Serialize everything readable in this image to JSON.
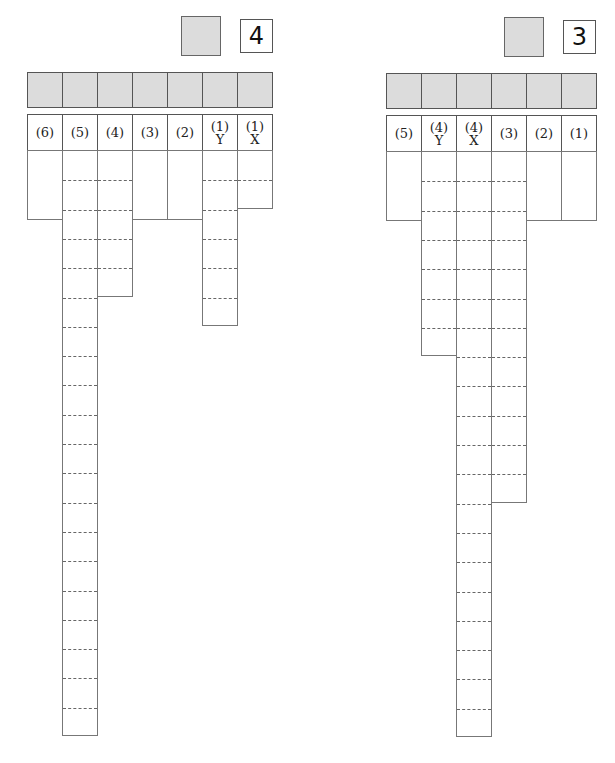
{
  "panels": [
    {
      "id": "left",
      "number_label": "4",
      "gray_square": {
        "x": 181,
        "y": 16,
        "w": 40,
        "h": 40
      },
      "number_box": {
        "x": 240,
        "y": 19,
        "w": 33,
        "h": 34
      },
      "grid_x": 27,
      "col_width": 35,
      "gray_row": {
        "y": 72,
        "h": 36
      },
      "header_row": {
        "y": 114,
        "h": 37
      },
      "data_top": 150,
      "row_unit": 29.3,
      "columns": [
        {
          "label_top": "(6)",
          "label_bottom": "",
          "rows": 2.4,
          "dashed": false
        },
        {
          "label_top": "(5)",
          "label_bottom": "",
          "rows": 20,
          "dashed": true
        },
        {
          "label_top": "(4)",
          "label_bottom": "",
          "rows": 5,
          "dashed": true
        },
        {
          "label_top": "(3)",
          "label_bottom": "",
          "rows": 2.4,
          "dashed": false
        },
        {
          "label_top": "(2)",
          "label_bottom": "",
          "rows": 2.4,
          "dashed": false
        },
        {
          "label_top": "(1)",
          "label_bottom": "Y",
          "rows": 6,
          "dashed": true
        },
        {
          "label_top": "(1)",
          "label_bottom": "X",
          "rows": 2,
          "dashed": true
        }
      ]
    },
    {
      "id": "right",
      "number_label": "3",
      "gray_square": {
        "x": 504,
        "y": 17,
        "w": 40,
        "h": 40
      },
      "number_box": {
        "x": 563,
        "y": 20,
        "w": 33,
        "h": 34
      },
      "grid_x": 386,
      "col_width": 35,
      "gray_row": {
        "y": 73,
        "h": 36
      },
      "header_row": {
        "y": 115,
        "h": 37
      },
      "data_top": 151,
      "row_unit": 29.3,
      "columns": [
        {
          "label_top": "(5)",
          "label_bottom": "",
          "rows": 2.4,
          "dashed": false
        },
        {
          "label_top": "(4)",
          "label_bottom": "Y",
          "rows": 7,
          "dashed": true
        },
        {
          "label_top": "(4)",
          "label_bottom": "X",
          "rows": 20,
          "dashed": true
        },
        {
          "label_top": "(3)",
          "label_bottom": "",
          "rows": 12,
          "dashed": true
        },
        {
          "label_top": "(2)",
          "label_bottom": "",
          "rows": 2.4,
          "dashed": false
        },
        {
          "label_top": "(1)",
          "label_bottom": "",
          "rows": 2.4,
          "dashed": false
        }
      ]
    }
  ]
}
